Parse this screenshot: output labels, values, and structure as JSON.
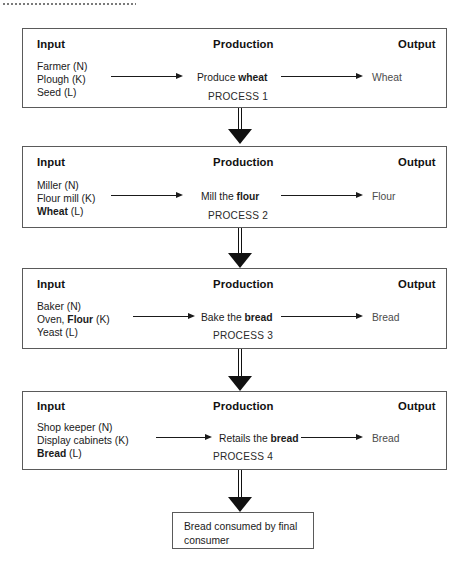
{
  "diagram": {
    "top_rule": "dotted-rule",
    "column_headers": {
      "input": "Input",
      "production": "Production",
      "output": "Output"
    },
    "colors": {
      "box_border": "#5a5a5a",
      "text": "#1a1a1a",
      "output_text": "#4b4b4b",
      "arrow": "#111111",
      "background": "#ffffff"
    },
    "stages": [
      {
        "id": "process-1",
        "inputs": [
          {
            "text": "Farmer (N)",
            "bold_part": ""
          },
          {
            "text": "Plough (K)",
            "bold_part": ""
          },
          {
            "text": "Seed (L)",
            "bold_part": ""
          }
        ],
        "production": "Produce wheat",
        "production_bold": "wheat",
        "output": "Wheat",
        "process_tag": "PROCESS 1"
      },
      {
        "id": "process-2",
        "inputs": [
          {
            "text": "Miller (N)",
            "bold_part": ""
          },
          {
            "text": "Flour mill (K)",
            "bold_part": ""
          },
          {
            "text": "Wheat (L)",
            "bold_part": "Wheat"
          }
        ],
        "production": "Mill the flour",
        "production_bold": "flour",
        "output": "Flour",
        "process_tag": "PROCESS 2"
      },
      {
        "id": "process-3",
        "inputs": [
          {
            "text": "Baker (N)",
            "bold_part": ""
          },
          {
            "text": "Oven, Flour (K)",
            "bold_part": "Flour"
          },
          {
            "text": "Yeast (L)",
            "bold_part": ""
          }
        ],
        "production": "Bake the bread",
        "production_bold": "bread",
        "output": "Bread",
        "process_tag": "PROCESS 3"
      },
      {
        "id": "process-4",
        "inputs": [
          {
            "text": "Shop keeper (N)",
            "bold_part": ""
          },
          {
            "text": "Display cabinets (K)",
            "bold_part": ""
          },
          {
            "text": "Bread (L)",
            "bold_part": "Bread"
          }
        ],
        "production": "Retails the bread",
        "production_bold": "bread",
        "output": "Bread",
        "process_tag": "PROCESS 4"
      }
    ],
    "final_node": {
      "text": "Bread consumed by final consumer"
    }
  }
}
